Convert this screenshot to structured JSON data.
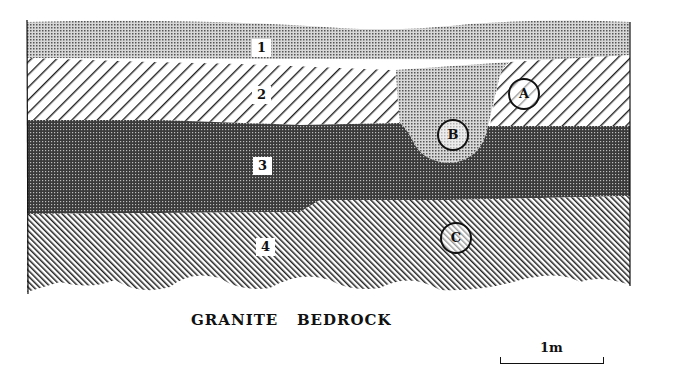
{
  "diagram": {
    "type": "stratigraphic-section",
    "layers": [
      {
        "id": "1",
        "label": "1",
        "pattern": "light-stipple"
      },
      {
        "id": "2",
        "label": "2",
        "pattern": "diagonal-hatch-backslash"
      },
      {
        "id": "3",
        "label": "3",
        "pattern": "dark-stipple"
      },
      {
        "id": "4",
        "label": "4",
        "pattern": "dense-diagonal-hatch-slash"
      }
    ],
    "markers": [
      {
        "id": "A",
        "label": "A"
      },
      {
        "id": "B",
        "label": "B"
      },
      {
        "id": "C",
        "label": "C"
      }
    ],
    "base_label": "GRANITE   BEDROCK",
    "scale": {
      "label": "1m"
    }
  }
}
